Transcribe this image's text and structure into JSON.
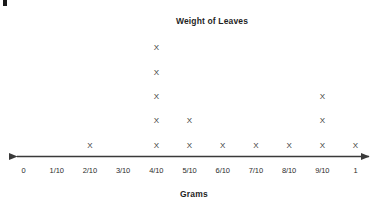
{
  "chart_data": {
    "type": "scatter",
    "plot_style": "dot-plot",
    "title": "Weight of Leaves",
    "xlabel": "Grams",
    "ylabel": "",
    "categories": [
      "0",
      "1/10",
      "2/10",
      "3/10",
      "4/10",
      "5/10",
      "6/10",
      "7/10",
      "8/10",
      "9/10",
      "1"
    ],
    "values": [
      0,
      0,
      1,
      0,
      5,
      2,
      1,
      1,
      1,
      3,
      1
    ],
    "marker": "X",
    "grid": false,
    "legend": null,
    "axis_arrows": "both",
    "total_marks": 15,
    "xlim": [
      "0",
      "1"
    ],
    "annotations": []
  },
  "chart": {
    "title": "Weight of Leaves",
    "axis_title": "Grams",
    "marker_glyph": "X",
    "tick_labels": [
      "0",
      "1/10",
      "2/10",
      "3/10",
      "4/10",
      "5/10",
      "6/10",
      "7/10",
      "8/10",
      "9/10",
      "1"
    ],
    "counts": [
      0,
      0,
      1,
      0,
      5,
      2,
      1,
      1,
      1,
      3,
      1
    ],
    "colors": {
      "axis": "#3a3a3a",
      "marker": "#3a3a3a",
      "text": "#1f1f1f",
      "background": "#ffffff"
    }
  }
}
